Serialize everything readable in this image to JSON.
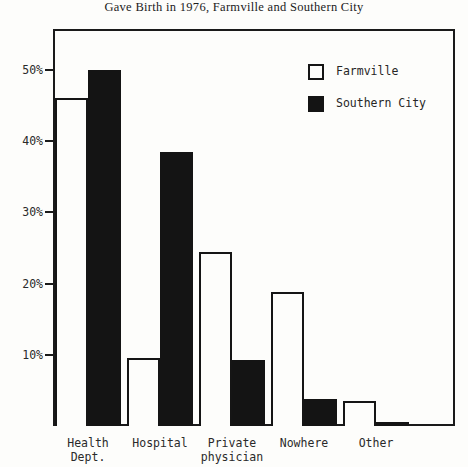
{
  "chart_data": {
    "type": "bar",
    "title": "Gave Birth in 1976, Farmville and Southern City",
    "xlabel": "",
    "ylabel": "",
    "ylim": [
      0,
      53.5
    ],
    "grid": false,
    "legend_position": "top-right",
    "categories": [
      "Health\nDept.",
      "Hospital",
      "Private\nphysician",
      "Nowhere",
      "Other"
    ],
    "ytick_labels": [
      "10%",
      "20%",
      "30%",
      "40%",
      "50%"
    ],
    "ytick_values": [
      10,
      20,
      30,
      40,
      50
    ],
    "series": [
      {
        "name": "Farmville",
        "color": "#ffffff",
        "values": [
          46.0,
          9.5,
          24.5,
          18.8,
          3.5
        ]
      },
      {
        "name": "Southern City",
        "color": "#141414",
        "values": [
          50.0,
          38.5,
          9.3,
          3.8,
          0.6
        ]
      }
    ]
  },
  "legend": {
    "items": [
      {
        "label": "Farmville",
        "swatch": "hollow-square-icon"
      },
      {
        "label": "Southern City",
        "swatch": "filled-square-icon"
      }
    ]
  }
}
